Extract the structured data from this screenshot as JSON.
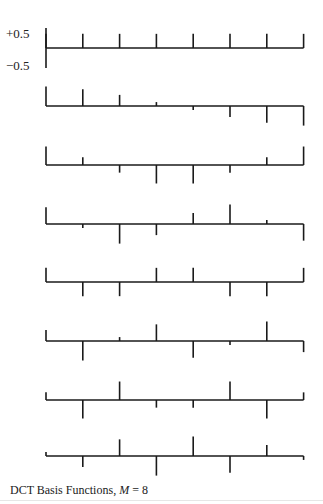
{
  "chart_data": {
    "type": "stem",
    "title": "DCT Basis Functions, M = 8",
    "caption_prefix": "DCT Basis Functions, ",
    "caption_var": "M",
    "caption_suffix": " = 8",
    "ytick_labels": [
      "+0.5",
      "−0.5"
    ],
    "yticks": [
      0.5,
      -0.5
    ],
    "xlabel": "",
    "ylabel": "",
    "grid": false,
    "legend": null,
    "n_points": 8,
    "x": [
      0,
      1,
      2,
      3,
      4,
      5,
      6,
      7
    ],
    "series": [
      {
        "name": "k=0",
        "values": [
          0.354,
          0.354,
          0.354,
          0.354,
          0.354,
          0.354,
          0.354,
          0.354
        ]
      },
      {
        "name": "k=1",
        "values": [
          0.49,
          0.416,
          0.278,
          0.098,
          -0.098,
          -0.278,
          -0.416,
          -0.49
        ]
      },
      {
        "name": "k=2",
        "values": [
          0.462,
          0.191,
          -0.191,
          -0.462,
          -0.462,
          -0.191,
          0.191,
          0.462
        ]
      },
      {
        "name": "k=3",
        "values": [
          0.416,
          -0.098,
          -0.49,
          -0.278,
          0.278,
          0.49,
          0.098,
          -0.416
        ]
      },
      {
        "name": "k=4",
        "values": [
          0.354,
          -0.354,
          -0.354,
          0.354,
          0.354,
          -0.354,
          -0.354,
          0.354
        ]
      },
      {
        "name": "k=5",
        "values": [
          0.278,
          -0.49,
          0.098,
          0.416,
          -0.416,
          -0.098,
          0.49,
          -0.278
        ]
      },
      {
        "name": "k=6",
        "values": [
          0.191,
          -0.462,
          0.462,
          -0.191,
          -0.191,
          0.462,
          -0.462,
          0.191
        ]
      },
      {
        "name": "k=7",
        "values": [
          0.098,
          -0.278,
          0.416,
          -0.49,
          0.49,
          -0.416,
          0.278,
          -0.098
        ]
      }
    ],
    "ylim": [
      -0.5,
      0.5
    ],
    "colors": {
      "stroke": "#1a1a1a",
      "background": "#ffffff"
    }
  }
}
